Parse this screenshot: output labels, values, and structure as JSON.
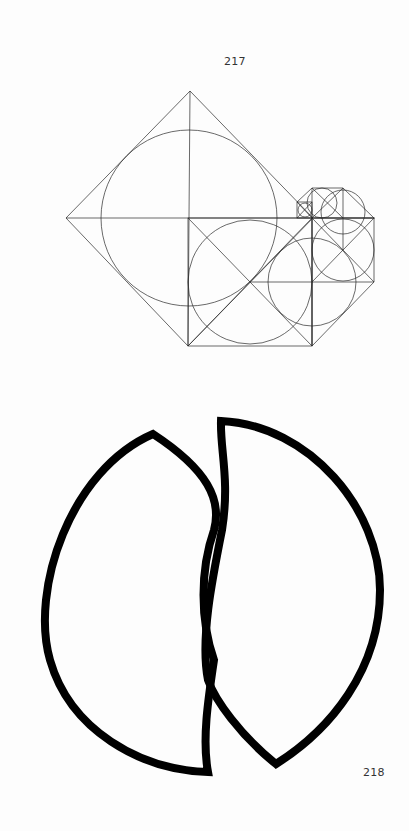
{
  "figures": [
    {
      "label": "217",
      "description": "Geometric construction of nested rotated squares with inscribed circles diminishing in a spiral"
    },
    {
      "label": "218",
      "description": "Two interlocking lens-shaped (vesica) outlines drawn with thick black strokes"
    }
  ],
  "colors": {
    "line": "#2a2a2a",
    "bold_stroke": "#000000",
    "background": "#fdfdfd",
    "label": "#333333"
  }
}
